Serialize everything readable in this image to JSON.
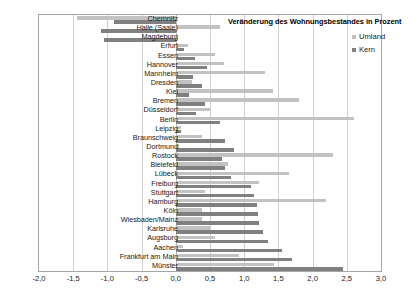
{
  "chart_data": {
    "type": "bar",
    "orientation": "horizontal",
    "title": "Veränderung des Wohnungsbestandes in Prozent",
    "xlabel": "",
    "ylabel": "",
    "xlim": [
      -2.0,
      3.0
    ],
    "grid": true,
    "legend_position": "top-right",
    "decimal_separator": ",",
    "xticks": [
      "-2,0",
      "-1,5",
      "-1,0",
      "-0,5",
      "0,0",
      "0,5",
      "1,0",
      "1,5",
      "2,0",
      "2,5",
      "3,0"
    ],
    "xtick_values": [
      -2.0,
      -1.5,
      -1.0,
      -0.5,
      0.0,
      0.5,
      1.0,
      1.5,
      2.0,
      2.5,
      3.0
    ],
    "categories": [
      "Chemnitz",
      "Halle (Saale)",
      "Magdeburg",
      "Erfurt",
      "Essen",
      "Hannover",
      "Mannheim",
      "Dresden",
      "Kiel",
      "Bremen",
      "Düsseldorf",
      "Berlin",
      "Leipzig",
      "Braunschweig",
      "Dortmund",
      "Rostock",
      "Bielefeld",
      "Lübeck",
      "Freiburg",
      "Stuttgart",
      "Hamburg",
      "Köln",
      "Wiesbaden/Mainz",
      "Karlsruhe",
      "Augsburg",
      "Aachen",
      "Frankfurt am Main",
      "Münster"
    ],
    "series": [
      {
        "name": "Umland",
        "color": "#c2c2c2",
        "values": [
          -1.45,
          0.65,
          0.0,
          0.18,
          0.58,
          0.7,
          1.3,
          0.23,
          1.42,
          1.8,
          0.5,
          2.6,
          0.08,
          0.38,
          0.05,
          2.3,
          0.77,
          1.65,
          1.22,
          0.43,
          2.2,
          0.38,
          0.38,
          0.5,
          0.58,
          0.1,
          0.92,
          1.43
        ]
      },
      {
        "name": "Kern",
        "color": "#808080",
        "values": [
          -0.9,
          -1.1,
          -1.05,
          0.12,
          0.28,
          0.45,
          0.25,
          0.38,
          0.2,
          0.43,
          0.3,
          0.65,
          0.08,
          0.72,
          0.85,
          0.68,
          0.72,
          0.8,
          1.1,
          1.15,
          1.18,
          1.2,
          1.22,
          1.28,
          1.35,
          1.55,
          1.7,
          2.45
        ]
      }
    ]
  },
  "legend": {
    "items": [
      {
        "label": "Umland",
        "color": "#c2c2c2"
      },
      {
        "label": "Kern",
        "color": "#808080"
      }
    ]
  }
}
